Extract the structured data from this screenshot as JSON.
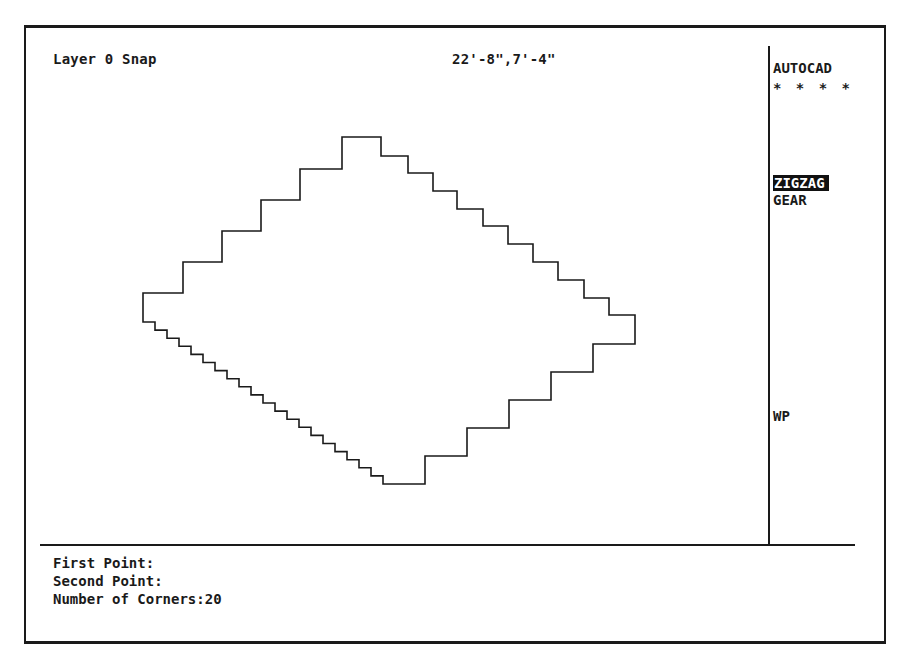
{
  "status": {
    "layer_label": "Layer 0 Snap",
    "coordinates": "22'-8\",7'-4\""
  },
  "side_menu": {
    "title": "AUTOCAD",
    "separator": "* * * *",
    "items": [
      {
        "label": "ZIGZAG",
        "selected": true
      },
      {
        "label": "GEAR",
        "selected": false
      },
      {
        "label": "WP",
        "selected": false
      }
    ]
  },
  "command_area": {
    "lines": [
      "First Point:",
      "Second Point:",
      "Number of Corners:20"
    ]
  },
  "drawing": {
    "shape": "zigzag-polygon",
    "corners": 20,
    "line_color": "#1a1a1a"
  }
}
